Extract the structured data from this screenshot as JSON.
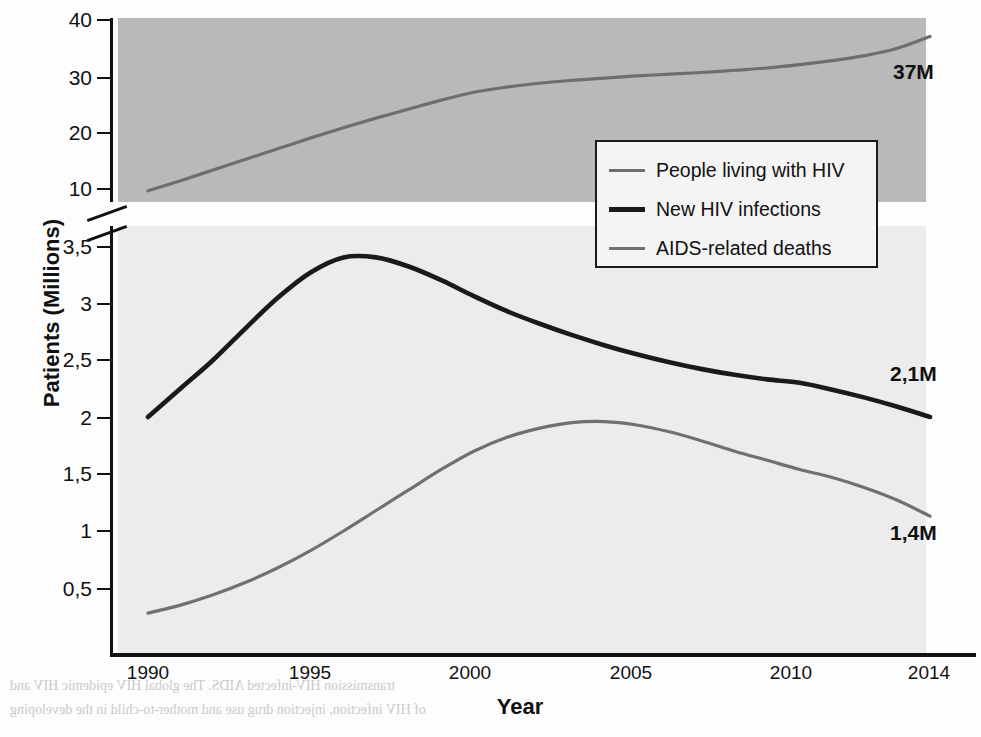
{
  "chart_data": {
    "type": "line",
    "title": "",
    "xlabel": "Year",
    "ylabel": "Patients (Millions)",
    "xlim": [
      1990,
      2014
    ],
    "x_ticks": [
      1990,
      1995,
      2000,
      2005,
      2010,
      2014
    ],
    "x_tick_labels": [
      "1990",
      "1995",
      "2000",
      "2005",
      "2010",
      "2014"
    ],
    "y_axis_note": "broken axis: lower segment 0-3.5, upper segment 10-40",
    "y_ticks_upper": [
      10,
      20,
      30,
      40
    ],
    "y_tick_labels_upper": [
      "10",
      "20",
      "30",
      "40"
    ],
    "y_ticks_lower": [
      0.5,
      1,
      1.5,
      2,
      2.5,
      3,
      3.5
    ],
    "y_tick_labels_lower": [
      "0,5",
      "1",
      "1,5",
      "2",
      "2,5",
      "3",
      "3,5"
    ],
    "grid": false,
    "legend_position": "upper-center-right",
    "series": [
      {
        "name": "People living with HIV",
        "color": "#6e6e6e",
        "x": [
          1990,
          1991,
          1992,
          1993,
          1994,
          1995,
          1996,
          1997,
          1998,
          1999,
          2000,
          2001,
          2002,
          2003,
          2004,
          2005,
          2006,
          2007,
          2008,
          2009,
          2010,
          2011,
          2012,
          2013,
          2014
        ],
        "values": [
          9.5,
          11.3,
          13.2,
          15.1,
          17.0,
          18.9,
          20.7,
          22.4,
          24.0,
          25.6,
          27.0,
          27.9,
          28.6,
          29.1,
          29.5,
          29.9,
          30.2,
          30.5,
          30.9,
          31.3,
          31.9,
          32.6,
          33.5,
          34.8,
          36.9
        ],
        "end_label": "37M"
      },
      {
        "name": "New HIV infections",
        "color": "#1a1a1a",
        "x": [
          1990,
          1991,
          1992,
          1993,
          1994,
          1995,
          1996,
          1997,
          1998,
          1999,
          2000,
          2001,
          2002,
          2003,
          2004,
          2005,
          2006,
          2007,
          2008,
          2009,
          2010,
          2011,
          2012,
          2013,
          2014
        ],
        "values": [
          2.0,
          2.25,
          2.5,
          2.78,
          3.05,
          3.27,
          3.4,
          3.4,
          3.32,
          3.2,
          3.06,
          2.93,
          2.82,
          2.72,
          2.63,
          2.55,
          2.48,
          2.42,
          2.37,
          2.33,
          2.3,
          2.24,
          2.17,
          2.09,
          2.0
        ],
        "end_label": "2,1M"
      },
      {
        "name": "AIDS-related deaths",
        "color": "#707070",
        "x": [
          1990,
          1991,
          1992,
          1993,
          1994,
          1995,
          1996,
          1997,
          1998,
          1999,
          2000,
          2001,
          2002,
          2003,
          2004,
          2005,
          2006,
          2007,
          2008,
          2009,
          2010,
          2011,
          2012,
          2013,
          2014
        ],
        "values": [
          0.28,
          0.35,
          0.44,
          0.55,
          0.68,
          0.83,
          1.0,
          1.18,
          1.36,
          1.54,
          1.7,
          1.82,
          1.9,
          1.95,
          1.96,
          1.93,
          1.87,
          1.79,
          1.7,
          1.62,
          1.54,
          1.47,
          1.38,
          1.27,
          1.13
        ],
        "end_label": "1,4M"
      }
    ],
    "end_labels": [
      {
        "text": "37M",
        "series": "People living with HIV"
      },
      {
        "text": "2,1M",
        "series": "New HIV infections"
      },
      {
        "text": "1,4M",
        "series": "AIDS-related deaths"
      }
    ],
    "colors": {
      "plot_upper_background": "#b9b9b9",
      "plot_lower_background": "#ececec",
      "axis": "#111111",
      "people_living_with_hiv": "#6e6e6e",
      "new_hiv_infections": "#1a1a1a",
      "aids_related_deaths": "#707070"
    }
  },
  "legend": {
    "items": [
      {
        "label": "People living with HIV"
      },
      {
        "label": "New HIV infections"
      },
      {
        "label": "AIDS-related deaths"
      }
    ]
  },
  "ghost_text": {
    "weeks": "Weeks",
    "year": "Year",
    "line1": "transmission HIV-infected AIDS. The global HIV epidemic HIV and",
    "line2": "of HIV infection, injection drug use and mother-to-child in the developing"
  }
}
